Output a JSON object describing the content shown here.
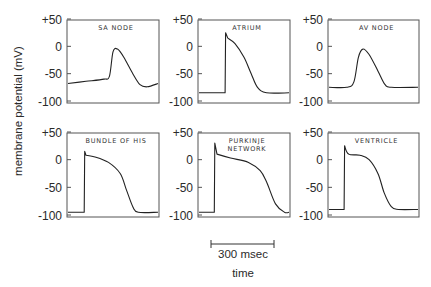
{
  "chart_data": {
    "type": "line",
    "title": "",
    "ylabel": "membrane potential (mV)",
    "xlabel": "time",
    "ylim": [
      -100,
      50
    ],
    "y_ticks": [
      "+50",
      "0",
      "-50",
      "-100"
    ],
    "scale_bar": {
      "label": "300 msec",
      "duration_ms": 300
    },
    "grid": false,
    "layout": {
      "rows": 2,
      "cols": 3
    },
    "panels": [
      {
        "name": "SA NODE",
        "title_lines": [
          "SA NODE"
        ],
        "description": "Slow depolarizing pacemaker potential rising from about -70 mV, peak near -5 mV, then repolarizing to about -75 mV",
        "x": [
          0,
          20,
          40,
          46,
          50,
          55,
          62,
          72,
          80,
          88,
          100
        ],
        "y": [
          -68,
          -64,
          -60,
          -55,
          -10,
          -5,
          -20,
          -50,
          -70,
          -74,
          -68
        ]
      },
      {
        "name": "ATRIUM",
        "title_lines": [
          "ATRIUM"
        ],
        "description": "Resting at about -85 mV, rapid upstroke to about +25 mV, gradual repolarization back to -85 mV",
        "x": [
          0,
          29,
          29.5,
          32,
          40,
          50,
          58,
          65,
          75,
          100
        ],
        "y": [
          -85,
          -85,
          25,
          15,
          5,
          -20,
          -50,
          -75,
          -85,
          -85
        ]
      },
      {
        "name": "AV NODE",
        "title_lines": [
          "AV NODE"
        ],
        "description": "Resting around -75 mV, slow upstroke to about -5 mV, repolarizing to -75 mV",
        "x": [
          0,
          20,
          28,
          33,
          38,
          45,
          55,
          63,
          70,
          100
        ],
        "y": [
          -75,
          -75,
          -65,
          -20,
          -5,
          -15,
          -45,
          -70,
          -75,
          -75
        ]
      },
      {
        "name": "BUNDLE OF HIS",
        "title_lines": [
          "BUNDLE OF HIS"
        ],
        "description": "Resting about -95 mV, upstroke to about +15 mV with long plateau near 0 mV, repolarizing to -95 mV",
        "x": [
          0,
          18,
          18.5,
          20,
          30,
          45,
          58,
          65,
          72,
          78,
          100
        ],
        "y": [
          -95,
          -95,
          15,
          8,
          5,
          -5,
          -25,
          -55,
          -85,
          -95,
          -95
        ]
      },
      {
        "name": "PURKINJE NETWORK",
        "title_lines": [
          "PURKINJE",
          "NETWORK"
        ],
        "description": "Resting about -95 mV, upstroke to about +30 mV, long plateau declining from 0 to -20 mV, repolarizing to -95 mV",
        "x": [
          0,
          17,
          17.5,
          20,
          35,
          55,
          68,
          75,
          85,
          95,
          100
        ],
        "y": [
          -95,
          -95,
          30,
          10,
          3,
          -5,
          -20,
          -40,
          -80,
          -95,
          -95
        ]
      },
      {
        "name": "VENTRICLE",
        "title_lines": [
          "VENTRICLE"
        ],
        "description": "Resting about -90 mV, upstroke to about +25 mV, plateau near +10 mV, repolarizing to -90 mV",
        "x": [
          0,
          17,
          17.5,
          22,
          35,
          45,
          55,
          62,
          70,
          78,
          100
        ],
        "y": [
          -90,
          -90,
          25,
          10,
          8,
          0,
          -25,
          -60,
          -85,
          -90,
          -90
        ]
      }
    ]
  }
}
